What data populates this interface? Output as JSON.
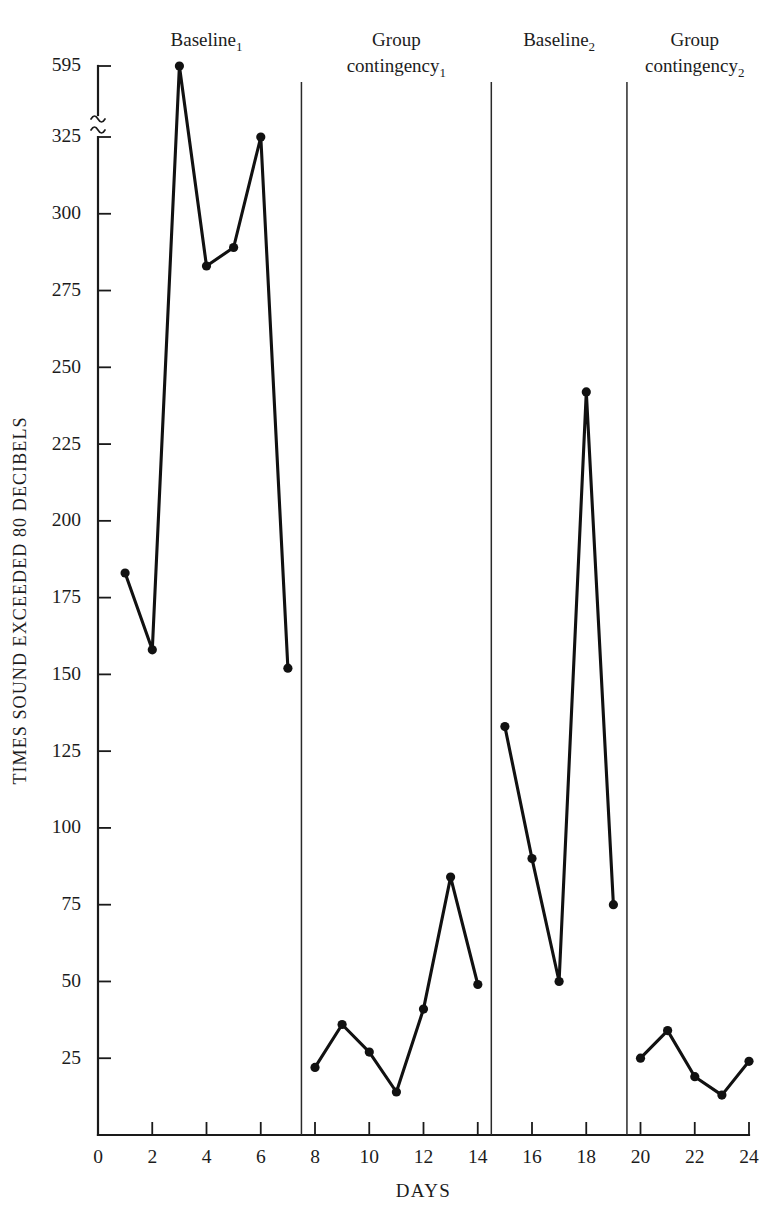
{
  "chart_data": {
    "type": "line",
    "title": "",
    "xlabel": "DAYS",
    "ylabel": "TIMES SOUND EXCEEDED 80 DECIBELS",
    "xlim": [
      0,
      24
    ],
    "ylim": [
      0,
      595
    ],
    "grid": false,
    "legend": "none",
    "axis_break": {
      "between": [
        325,
        595
      ],
      "symbol": "~"
    },
    "xticks": [
      0,
      2,
      4,
      6,
      8,
      10,
      12,
      14,
      16,
      18,
      20,
      22,
      24
    ],
    "yticks": [
      25,
      50,
      75,
      100,
      125,
      150,
      175,
      200,
      225,
      250,
      275,
      300,
      325,
      595
    ],
    "x": [
      1,
      2,
      3,
      4,
      5,
      6,
      7,
      8,
      9,
      10,
      11,
      12,
      13,
      14,
      15,
      16,
      17,
      18,
      19,
      20,
      21,
      22,
      23,
      24
    ],
    "series": [
      {
        "name": "Times sound exceeded 80 decibels",
        "values": [
          183,
          158,
          595,
          283,
          289,
          325,
          152,
          22,
          36,
          27,
          14,
          41,
          84,
          49,
          133,
          90,
          50,
          242,
          75,
          25,
          34,
          19,
          13,
          24
        ]
      }
    ],
    "phases": [
      {
        "label": "Baseline",
        "subscript": "1",
        "days": [
          1,
          7
        ],
        "divider_after": 7.5
      },
      {
        "label": "Group contingency",
        "subscript": "1",
        "days": [
          8,
          14
        ],
        "divider_after": 14.5
      },
      {
        "label": "Baseline",
        "subscript": "2",
        "days": [
          15,
          19
        ],
        "divider_after": 19.5
      },
      {
        "label": "Group contingency",
        "subscript": "2",
        "days": [
          20,
          24
        ],
        "divider_after": null
      }
    ],
    "colors": {
      "line": "#111111",
      "marker": "#111111",
      "axis": "#1a1a1a",
      "text": "#1c1c1c",
      "background": "#ffffff"
    }
  },
  "axes": {
    "y_title": "TIMES SOUND EXCEEDED 80 DECIBELS",
    "x_title": "DAYS",
    "y_tick_labels": [
      "595",
      "325",
      "300",
      "275",
      "250",
      "225",
      "200",
      "175",
      "150",
      "125",
      "100",
      "75",
      "50",
      "25"
    ],
    "x_tick_labels": [
      "0",
      "2",
      "4",
      "6",
      "8",
      "10",
      "12",
      "14",
      "16",
      "18",
      "20",
      "22",
      "24"
    ]
  },
  "phase_labels": [
    {
      "line1": "Baseline",
      "line2": "",
      "sub": "1"
    },
    {
      "line1": "Group",
      "line2": "contingency",
      "sub": "1"
    },
    {
      "line1": "Baseline",
      "line2": "",
      "sub": "2"
    },
    {
      "line1": "Group",
      "line2": "contingency",
      "sub": "2"
    }
  ]
}
